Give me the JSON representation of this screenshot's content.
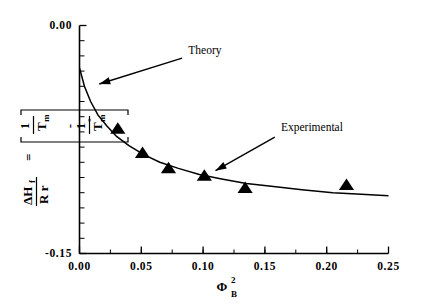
{
  "chart_data": {
    "type": "scatter",
    "title": "",
    "xlabel": "ΦB2",
    "xlabel_parts": {
      "base": "Φ",
      "sub": "B",
      "sup": "2"
    },
    "ylabel": "ΔHf / (R r) = [ 1/Tm - 1/Tm° ]",
    "ylabel_parts": {
      "num": "ΔH",
      "num_sub": "f",
      "den": "R r",
      "eq": "=",
      "term1_num": "1",
      "term1_den": "T",
      "term1_den_sub": "m",
      "minus": "-",
      "term2_num": "1",
      "term2_den": "T",
      "term2_den_sub": "m",
      "term2_den_sup": "°"
    },
    "xlim": [
      0.0,
      0.25
    ],
    "ylim": [
      -0.15,
      0.0
    ],
    "xticks": [
      0.0,
      0.05,
      0.1,
      0.15,
      0.2,
      0.25
    ],
    "xtick_labels": [
      "0.00",
      "0.05",
      "0.10",
      "0.15",
      "0.20",
      "0.25"
    ],
    "yticks": [
      0.0,
      -0.15
    ],
    "ytick_labels": [
      "0.00",
      "-0.15"
    ],
    "y_minor_count": 15,
    "x_minor_count": 10,
    "grid": false,
    "legend": "none",
    "series": [
      {
        "name": "Experimental",
        "type": "scatter",
        "marker": "triangle-up",
        "color": "#000000",
        "points": [
          {
            "x": 0.031,
            "y": -0.068
          },
          {
            "x": 0.051,
            "y": -0.084
          },
          {
            "x": 0.072,
            "y": -0.094
          },
          {
            "x": 0.101,
            "y": -0.099
          },
          {
            "x": 0.134,
            "y": -0.107
          },
          {
            "x": 0.216,
            "y": -0.105
          }
        ]
      },
      {
        "name": "Theory",
        "type": "line",
        "color": "#000000",
        "points": [
          {
            "x": 0.0,
            "y": -0.028
          },
          {
            "x": 0.004,
            "y": -0.04
          },
          {
            "x": 0.009,
            "y": -0.05
          },
          {
            "x": 0.015,
            "y": -0.059
          },
          {
            "x": 0.022,
            "y": -0.066
          },
          {
            "x": 0.03,
            "y": -0.073
          },
          {
            "x": 0.04,
            "y": -0.079
          },
          {
            "x": 0.052,
            "y": -0.085
          },
          {
            "x": 0.065,
            "y": -0.09
          },
          {
            "x": 0.08,
            "y": -0.094
          },
          {
            "x": 0.097,
            "y": -0.098
          },
          {
            "x": 0.115,
            "y": -0.101
          },
          {
            "x": 0.135,
            "y": -0.104
          },
          {
            "x": 0.157,
            "y": -0.106
          },
          {
            "x": 0.18,
            "y": -0.108
          },
          {
            "x": 0.205,
            "y": -0.11
          },
          {
            "x": 0.228,
            "y": -0.111
          },
          {
            "x": 0.25,
            "y": -0.112
          }
        ]
      }
    ],
    "annotations": [
      {
        "text": "Theory",
        "text_x": 0.088,
        "text_y": -0.0185,
        "arrow_from_x": 0.083,
        "arrow_from_y": -0.0215,
        "arrow_to_x": 0.016,
        "arrow_to_y": -0.0385
      },
      {
        "text": "Experimental",
        "text_x": 0.163,
        "text_y": -0.0695,
        "arrow_from_x": 0.158,
        "arrow_from_y": -0.0735,
        "arrow_to_x": 0.11,
        "arrow_to_y": -0.0955
      }
    ]
  }
}
